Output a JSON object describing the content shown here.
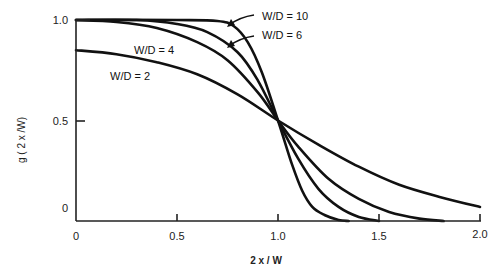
{
  "chart_data": {
    "type": "line",
    "title": "",
    "xlabel": "2 x / W",
    "ylabel": "g ( 2 x /W)",
    "xlim": [
      0,
      2.0
    ],
    "ylim": [
      0,
      1.0
    ],
    "grid": false,
    "legend": "inline labels with arrows",
    "x_ticks": [
      {
        "value": 0,
        "label": "0"
      },
      {
        "value": 0.5,
        "label": "0.5"
      },
      {
        "value": 1.0,
        "label": "1.0"
      },
      {
        "value": 1.5,
        "label": "1.5"
      },
      {
        "value": 2.0,
        "label": "2.0"
      }
    ],
    "y_ticks": [
      {
        "value": 0,
        "label": "0"
      },
      {
        "value": 0.5,
        "label": "0.5"
      },
      {
        "value": 1.0,
        "label": "1.0"
      }
    ],
    "series": [
      {
        "name": "W/D = 2",
        "label": "W/D = 2",
        "x": [
          0,
          0.2,
          0.4,
          0.6,
          0.8,
          1.0,
          1.2,
          1.4,
          1.6,
          1.8,
          2.0
        ],
        "y": [
          0.85,
          0.83,
          0.79,
          0.73,
          0.63,
          0.5,
          0.38,
          0.27,
          0.18,
          0.12,
          0.07
        ]
      },
      {
        "name": "W/D = 4",
        "label": "W/D = 4",
        "x": [
          0,
          0.2,
          0.4,
          0.6,
          0.75,
          0.9,
          1.0,
          1.1,
          1.25,
          1.4,
          1.55,
          1.7,
          1.82
        ],
        "y": [
          1.0,
          0.99,
          0.96,
          0.89,
          0.8,
          0.64,
          0.5,
          0.37,
          0.21,
          0.11,
          0.045,
          0.012,
          0.0
        ]
      },
      {
        "name": "W/D = 6",
        "label": "W/D = 6",
        "x": [
          0,
          0.3,
          0.5,
          0.65,
          0.8,
          0.9,
          1.0,
          1.1,
          1.2,
          1.3,
          1.4,
          1.5
        ],
        "y": [
          1.0,
          1.0,
          0.98,
          0.94,
          0.84,
          0.7,
          0.5,
          0.31,
          0.16,
          0.07,
          0.02,
          0.0
        ]
      },
      {
        "name": "W/D = 10",
        "label": "W/D = 10",
        "x": [
          0,
          0.5,
          0.7,
          0.78,
          0.85,
          0.92,
          1.0,
          1.07,
          1.12,
          1.17,
          1.23,
          1.3,
          1.35
        ],
        "y": [
          1.0,
          1.0,
          0.995,
          0.97,
          0.89,
          0.74,
          0.5,
          0.28,
          0.15,
          0.07,
          0.03,
          0.005,
          0.0
        ]
      }
    ],
    "annotations": [
      {
        "text": "W/D = 10",
        "arrow_to": [
          0.75,
          0.98
        ]
      },
      {
        "text": "W/D = 6",
        "arrow_to": [
          0.75,
          0.87
        ]
      }
    ]
  }
}
